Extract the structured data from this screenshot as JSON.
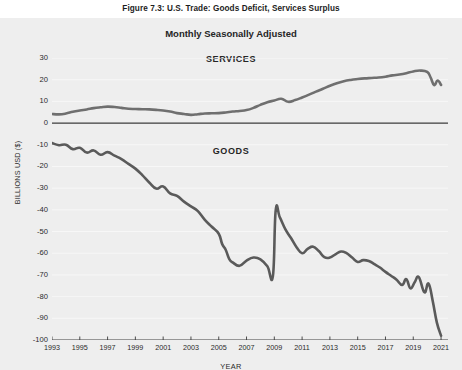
{
  "figure": {
    "caption": "Figure 7.3: U.S. Trade: Goods Deficit, Services Surplus"
  },
  "axis_titles": {
    "y": "BILLIONS USD ($)",
    "x": "YEAR"
  },
  "annotations": {
    "services": "SERVICES",
    "goods": "GOODS"
  },
  "style": {
    "panel_bg": "#eeeeee",
    "line_color": "#6f6f6f",
    "goods_line_color": "#5a5a5a",
    "zero_line_color": "#3a3a3a",
    "grid_color": "#f7f7f7",
    "text_color": "#2a2a2a"
  },
  "chart_data": {
    "type": "line",
    "title": "Monthly Seasonally Adjusted",
    "xlabel": "YEAR",
    "ylabel": "BILLIONS USD ($)",
    "xlim": [
      1993,
      2021.5
    ],
    "ylim": [
      -100,
      30
    ],
    "yticks": [
      30,
      20,
      10,
      0,
      -10,
      -20,
      -30,
      -40,
      -50,
      -60,
      -70,
      -80,
      -90,
      -100
    ],
    "xticks": [
      1993,
      1995,
      1997,
      1999,
      2001,
      2003,
      2005,
      2007,
      2009,
      2011,
      2013,
      2015,
      2017,
      2019,
      2021
    ],
    "grid": true,
    "legend": "inline-annotation",
    "zero_line": 0,
    "series": [
      {
        "name": "SERVICES",
        "color": "#6f6f6f",
        "x": [
          1993.0,
          1993.5,
          1994.0,
          1994.5,
          1995.0,
          1995.5,
          1996.0,
          1996.5,
          1997.0,
          1997.5,
          1998.0,
          1998.5,
          1999.0,
          1999.5,
          2000.0,
          2000.5,
          2001.0,
          2001.5,
          2002.0,
          2002.5,
          2003.0,
          2003.5,
          2004.0,
          2004.5,
          2005.0,
          2005.5,
          2006.0,
          2006.5,
          2007.0,
          2007.5,
          2008.0,
          2008.5,
          2009.0,
          2009.5,
          2010.0,
          2010.5,
          2011.0,
          2011.5,
          2012.0,
          2012.5,
          2013.0,
          2013.5,
          2014.0,
          2014.5,
          2015.0,
          2015.5,
          2016.0,
          2016.5,
          2017.0,
          2017.5,
          2018.0,
          2018.5,
          2019.0,
          2019.5,
          2020.0,
          2020.25,
          2020.5,
          2020.75,
          2021.0
        ],
        "values": [
          4.2,
          4.0,
          4.4,
          5.2,
          5.8,
          6.3,
          6.9,
          7.3,
          7.6,
          7.4,
          7.0,
          6.6,
          6.5,
          6.4,
          6.3,
          6.1,
          5.8,
          5.3,
          4.6,
          4.2,
          3.8,
          4.1,
          4.4,
          4.5,
          4.6,
          4.9,
          5.3,
          5.6,
          6.0,
          7.0,
          8.4,
          9.6,
          10.4,
          11.2,
          9.8,
          10.6,
          11.8,
          13.1,
          14.5,
          15.8,
          17.2,
          18.4,
          19.3,
          19.9,
          20.3,
          20.6,
          20.8,
          21.0,
          21.4,
          22.0,
          22.4,
          23.0,
          23.8,
          24.2,
          23.6,
          21.0,
          17.5,
          19.6,
          17.6
        ]
      },
      {
        "name": "GOODS",
        "color": "#5a5a5a",
        "x": [
          1993.0,
          1993.5,
          1994.0,
          1994.5,
          1995.0,
          1995.5,
          1996.0,
          1996.5,
          1997.0,
          1997.5,
          1998.0,
          1998.5,
          1999.0,
          1999.5,
          2000.0,
          2000.5,
          2001.0,
          2001.5,
          2002.0,
          2002.5,
          2003.0,
          2003.5,
          2004.0,
          2004.5,
          2005.0,
          2005.25,
          2005.5,
          2005.75,
          2006.0,
          2006.5,
          2007.0,
          2007.5,
          2008.0,
          2008.5,
          2008.9,
          2009.1,
          2009.4,
          2009.8,
          2010.2,
          2010.6,
          2011.0,
          2011.4,
          2011.8,
          2012.2,
          2012.6,
          2013.0,
          2013.4,
          2013.8,
          2014.2,
          2014.6,
          2015.0,
          2015.4,
          2015.8,
          2016.2,
          2016.6,
          2017.0,
          2017.4,
          2017.8,
          2018.2,
          2018.5,
          2018.8,
          2019.1,
          2019.4,
          2019.8,
          2020.1,
          2020.4,
          2020.7,
          2021.0
        ],
        "values": [
          -9.2,
          -10.2,
          -10.0,
          -12.0,
          -11.4,
          -13.6,
          -12.6,
          -14.6,
          -13.4,
          -15.0,
          -16.6,
          -18.8,
          -21.0,
          -24.0,
          -27.4,
          -30.2,
          -29.2,
          -32.4,
          -33.6,
          -36.2,
          -38.4,
          -40.6,
          -44.6,
          -47.8,
          -51.0,
          -55.8,
          -58.4,
          -62.6,
          -64.2,
          -65.8,
          -63.4,
          -62.0,
          -62.8,
          -66.0,
          -70.4,
          -40.2,
          -43.5,
          -49.0,
          -53.0,
          -57.2,
          -60.0,
          -58.0,
          -57.0,
          -59.0,
          -61.8,
          -62.0,
          -60.5,
          -59.2,
          -60.0,
          -62.0,
          -64.0,
          -63.2,
          -63.6,
          -65.0,
          -66.6,
          -68.6,
          -70.4,
          -72.2,
          -74.6,
          -72.0,
          -76.2,
          -73.4,
          -71.0,
          -78.0,
          -74.0,
          -82.0,
          -92.0,
          -98.0
        ]
      }
    ]
  }
}
